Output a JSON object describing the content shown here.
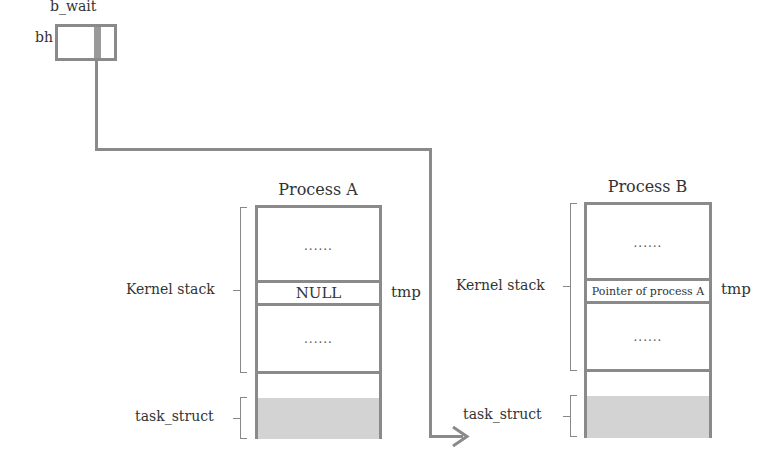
{
  "buffer_head": {
    "label": "bh",
    "field_label": "b_wait"
  },
  "processes": [
    {
      "title": "Process A",
      "kernel_stack_label": "Kernel stack",
      "task_struct_label": "task_struct",
      "tmp_label": "tmp",
      "rows": {
        "top": "......",
        "tmp_value": "NULL",
        "middle": "......"
      }
    },
    {
      "title": "Process B",
      "kernel_stack_label": "Kernel stack",
      "task_struct_label": "task_struct",
      "tmp_label": "tmp",
      "rows": {
        "top": "......",
        "tmp_value": "Pointer of process A",
        "middle": "......"
      }
    }
  ],
  "colors": {
    "outline": "#8a8a8a",
    "task_struct_fill": "#d3d3d3"
  }
}
